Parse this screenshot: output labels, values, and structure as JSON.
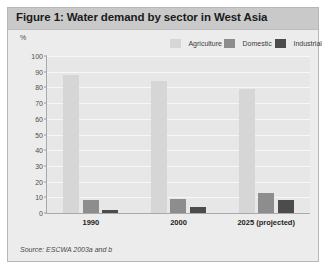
{
  "figure": {
    "title": "Figure 1: Water demand by sector in West Asia",
    "source": "Source: ESCWA 2003a and b",
    "y_unit": "%"
  },
  "legend": {
    "agriculture": "Agriculture",
    "domestic": "Domestic",
    "industrial": "Industrial"
  },
  "colors": {
    "agriculture": "#d6d6d6",
    "domestic": "#8d8d8d",
    "industrial": "#4c4c4c",
    "title_bar": "#c9c9c9",
    "plot_background": "#e7e7e7",
    "gridline": "#f7f7f7"
  },
  "axis": {
    "ticks": [
      "100",
      "90",
      "80",
      "70",
      "60",
      "50",
      "40",
      "30",
      "20",
      "10",
      "0"
    ]
  },
  "chart_data": {
    "type": "bar",
    "title": "Figure 1: Water demand by sector in West Asia",
    "xlabel": "",
    "ylabel": "%",
    "ylim": [
      0,
      100
    ],
    "yticks": [
      0,
      10,
      20,
      30,
      40,
      50,
      60,
      70,
      80,
      90,
      100
    ],
    "grid": true,
    "legend_position": "top-right",
    "categories": [
      "1990",
      "2000",
      "2025 (projected)"
    ],
    "series": [
      {
        "name": "Agriculture",
        "values": [
          88,
          84,
          79
        ]
      },
      {
        "name": "Domestic",
        "values": [
          8,
          9,
          13
        ]
      },
      {
        "name": "Industrial",
        "values": [
          2,
          4,
          8
        ]
      }
    ],
    "annotations": [
      "Source: ESCWA 2003a and b"
    ]
  }
}
